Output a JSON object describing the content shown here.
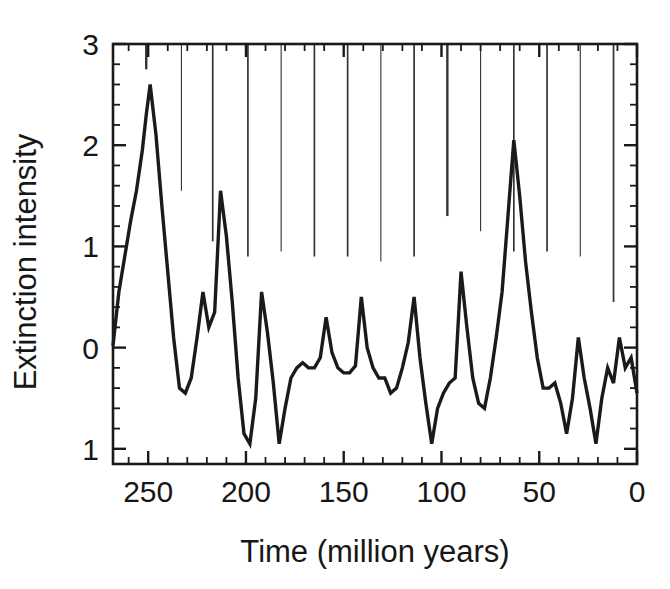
{
  "chart_data": {
    "type": "line",
    "title": "",
    "xlabel": "Time (million years)",
    "ylabel": "Extinction intensity",
    "xlim": [
      268,
      0
    ],
    "ylim": [
      3,
      -1.15
    ],
    "x_inverted": true,
    "y_inverted": true,
    "grid": false,
    "legend": null,
    "xticks": [
      250,
      200,
      150,
      100,
      50,
      0
    ],
    "xtick_labels": [
      "250",
      "200",
      "150",
      "100",
      "50",
      "0"
    ],
    "x_minor_tick_step": 10,
    "yticks": [
      3,
      2,
      1,
      0,
      -1
    ],
    "ytick_labels": [
      "3",
      "2",
      "1",
      "0",
      "1"
    ],
    "y_minor_tick_step": 0.2,
    "series": [
      {
        "name": "Extinction intensity",
        "x": [
          268,
          265,
          262,
          259,
          256,
          253,
          251,
          249,
          246,
          243,
          240,
          237,
          234,
          231,
          228,
          225,
          222,
          219,
          216,
          213,
          210,
          207,
          204,
          201,
          198,
          195,
          192,
          189,
          186,
          183,
          180,
          177,
          174,
          171,
          168,
          165,
          162,
          159,
          156,
          153,
          150,
          147,
          144,
          141,
          138,
          135,
          132,
          129,
          126,
          123,
          120,
          117,
          114,
          111,
          108,
          105,
          102,
          99,
          96,
          93,
          90,
          87,
          84,
          81,
          78,
          75,
          72,
          69,
          66,
          63,
          60,
          57,
          54,
          51,
          48,
          45,
          42,
          39,
          36,
          33,
          30,
          27,
          24,
          21,
          18,
          15,
          12,
          9,
          6,
          3,
          0
        ],
        "y": [
          0.02,
          0.55,
          0.9,
          1.25,
          1.55,
          1.95,
          2.3,
          2.6,
          2.1,
          1.4,
          0.75,
          0.1,
          -0.4,
          -0.45,
          -0.3,
          0.1,
          0.55,
          0.2,
          0.35,
          1.55,
          1.1,
          0.45,
          -0.3,
          -0.85,
          -0.95,
          -0.5,
          0.55,
          0.15,
          -0.35,
          -0.95,
          -0.6,
          -0.3,
          -0.2,
          -0.15,
          -0.2,
          -0.2,
          -0.1,
          0.3,
          -0.05,
          -0.2,
          -0.25,
          -0.25,
          -0.18,
          0.5,
          0.0,
          -0.2,
          -0.3,
          -0.3,
          -0.45,
          -0.4,
          -0.2,
          0.05,
          0.5,
          -0.1,
          -0.55,
          -0.95,
          -0.6,
          -0.45,
          -0.35,
          -0.3,
          0.75,
          0.2,
          -0.3,
          -0.55,
          -0.6,
          -0.3,
          0.1,
          0.55,
          1.3,
          2.05,
          1.5,
          0.85,
          0.35,
          -0.1,
          -0.4,
          -0.4,
          -0.35,
          -0.55,
          -0.85,
          -0.5,
          0.1,
          -0.3,
          -0.6,
          -0.95,
          -0.5,
          -0.2,
          -0.35,
          0.1,
          -0.2,
          -0.1,
          -0.45
        ]
      }
    ],
    "event_markers": {
      "description": "vertical drop lines from top axis",
      "x": [
        251,
        233,
        217,
        199,
        182,
        165,
        148,
        131,
        114,
        97,
        80,
        63,
        46,
        29,
        12
      ],
      "depth_to_y": [
        2.75,
        1.55,
        1.05,
        0.9,
        0.95,
        0.9,
        0.9,
        0.85,
        0.9,
        1.3,
        1.15,
        0.95,
        0.95,
        0.9,
        0.45
      ]
    }
  },
  "axis": {
    "y_label": "Extinction intensity",
    "x_label": "Time (million years)"
  },
  "colors": {
    "line": "#1a1a1a",
    "axis": "#1a1a1a",
    "background": "#ffffff",
    "dropline": "#333333"
  }
}
